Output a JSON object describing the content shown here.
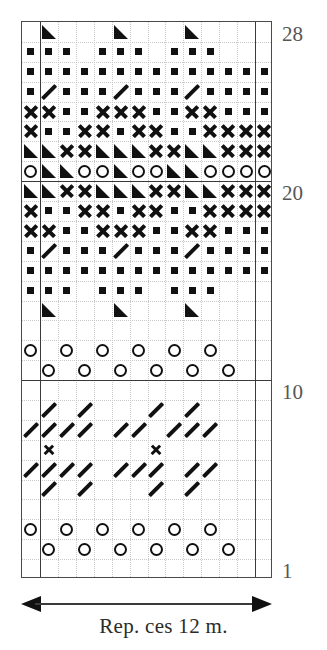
{
  "chart_data": {
    "type": "table",
    "title": "",
    "columns": 14,
    "rows": 28,
    "row_number_labels": [
      "28",
      "20",
      "10",
      "1"
    ],
    "row_numbers_shown": [
      28,
      20,
      10,
      1
    ],
    "legend": {
      "square": "filled-square",
      "cross": "cross",
      "triangle": "filled-triangle",
      "circle": "open-circle",
      "slash": "diagonal-slash",
      "empty": "blank"
    },
    "repeat_stitches": 12,
    "heavy_vertical_rules_after_columns": [
      1,
      13
    ],
    "heavy_horizontal_rules_after_rows": [
      10,
      20
    ],
    "grid": [
      [
        "empty",
        "tri",
        "empty",
        "empty",
        "empty",
        "tri",
        "empty",
        "empty",
        "empty",
        "tri",
        "empty",
        "empty",
        "empty",
        "empty"
      ],
      [
        "square",
        "square",
        "square",
        "empty",
        "square",
        "square",
        "square",
        "empty",
        "square",
        "square",
        "square",
        "empty",
        "empty",
        "empty"
      ],
      [
        "square",
        "square",
        "square",
        "square",
        "square",
        "square",
        "square",
        "square",
        "square",
        "square",
        "square",
        "square",
        "square",
        "square"
      ],
      [
        "square",
        "slash",
        "square",
        "square",
        "square",
        "slash",
        "square",
        "square",
        "square",
        "slash",
        "square",
        "square",
        "square",
        "square"
      ],
      [
        "cross",
        "cross",
        "square",
        "square",
        "cross",
        "cross",
        "cross",
        "square",
        "square",
        "cross",
        "cross",
        "square",
        "square",
        "square"
      ],
      [
        "cross",
        "square",
        "square",
        "cross",
        "cross",
        "square",
        "cross",
        "cross",
        "square",
        "square",
        "cross",
        "cross",
        "cross",
        "cross"
      ],
      [
        "tri",
        "tri",
        "cross",
        "cross",
        "tri",
        "tri",
        "tri",
        "cross",
        "cross",
        "tri",
        "tri",
        "cross",
        "cross",
        "cross"
      ],
      [
        "circle",
        "tri",
        "tri",
        "circle",
        "circle",
        "tri",
        "circle",
        "circle",
        "tri",
        "tri",
        "circle",
        "circle",
        "circle",
        "circle"
      ],
      [
        "tri",
        "tri",
        "cross",
        "cross",
        "tri",
        "tri",
        "tri",
        "cross",
        "cross",
        "tri",
        "tri",
        "cross",
        "cross",
        "cross"
      ],
      [
        "cross",
        "square",
        "square",
        "cross",
        "cross",
        "square",
        "cross",
        "cross",
        "square",
        "square",
        "cross",
        "cross",
        "cross",
        "cross"
      ],
      [
        "cross",
        "cross",
        "square",
        "square",
        "cross",
        "cross",
        "cross",
        "square",
        "square",
        "cross",
        "cross",
        "square",
        "square",
        "square"
      ],
      [
        "square",
        "slash",
        "square",
        "square",
        "square",
        "slash",
        "square",
        "square",
        "square",
        "slash",
        "square",
        "square",
        "square",
        "square"
      ],
      [
        "square",
        "square",
        "square",
        "square",
        "square",
        "square",
        "square",
        "square",
        "square",
        "square",
        "square",
        "square",
        "square",
        "square"
      ],
      [
        "square",
        "square",
        "square",
        "empty",
        "square",
        "square",
        "square",
        "empty",
        "square",
        "square",
        "square",
        "empty",
        "empty",
        "empty"
      ],
      [
        "empty",
        "tri",
        "empty",
        "empty",
        "empty",
        "tri",
        "empty",
        "empty",
        "empty",
        "tri",
        "empty",
        "empty",
        "empty",
        "empty"
      ],
      [
        "empty",
        "empty",
        "empty",
        "empty",
        "empty",
        "empty",
        "empty",
        "empty",
        "empty",
        "empty",
        "empty",
        "empty",
        "empty",
        "empty"
      ],
      [
        "circle",
        "empty",
        "circle",
        "empty",
        "circle",
        "empty",
        "circle",
        "empty",
        "circle",
        "empty",
        "circle",
        "empty",
        "empty",
        "empty"
      ],
      [
        "empty",
        "circle",
        "empty",
        "circle",
        "empty",
        "circle",
        "empty",
        "circle",
        "empty",
        "circle",
        "empty",
        "circle",
        "empty",
        "empty"
      ],
      [
        "empty",
        "empty",
        "empty",
        "empty",
        "empty",
        "empty",
        "empty",
        "empty",
        "empty",
        "empty",
        "empty",
        "empty",
        "empty",
        "empty"
      ],
      [
        "empty",
        "slash",
        "empty",
        "slash",
        "empty",
        "empty",
        "empty",
        "slash",
        "empty",
        "slash",
        "empty",
        "empty",
        "empty",
        "empty"
      ],
      [
        "slash",
        "slash",
        "slash",
        "slash",
        "empty",
        "slash",
        "slash",
        "empty",
        "slash",
        "slash",
        "slash",
        "empty",
        "empty",
        "empty"
      ],
      [
        "empty",
        "crossSmall",
        "empty",
        "empty",
        "empty",
        "empty",
        "empty",
        "crossSmall",
        "empty",
        "empty",
        "empty",
        "empty",
        "empty",
        "empty"
      ],
      [
        "slash",
        "slash",
        "slash",
        "slash",
        "empty",
        "slash",
        "slash",
        "slash",
        "empty",
        "slash",
        "slash",
        "empty",
        "empty",
        "empty"
      ],
      [
        "empty",
        "slash",
        "empty",
        "slash",
        "empty",
        "empty",
        "empty",
        "slash",
        "empty",
        "slash",
        "empty",
        "empty",
        "empty",
        "empty"
      ],
      [
        "empty",
        "empty",
        "empty",
        "empty",
        "empty",
        "empty",
        "empty",
        "empty",
        "empty",
        "empty",
        "empty",
        "empty",
        "empty",
        "empty"
      ],
      [
        "circle",
        "empty",
        "circle",
        "empty",
        "circle",
        "empty",
        "circle",
        "empty",
        "circle",
        "empty",
        "circle",
        "empty",
        "empty",
        "empty"
      ],
      [
        "empty",
        "circle",
        "empty",
        "circle",
        "empty",
        "circle",
        "empty",
        "circle",
        "empty",
        "circle",
        "empty",
        "circle",
        "empty",
        "empty"
      ],
      [
        "empty",
        "empty",
        "empty",
        "empty",
        "empty",
        "empty",
        "empty",
        "empty",
        "empty",
        "empty",
        "empty",
        "empty",
        "empty",
        "empty"
      ]
    ]
  },
  "row_labels": [
    {
      "text": "28",
      "row_from_bottom": 28
    },
    {
      "text": "20",
      "row_from_bottom": 20
    },
    {
      "text": "10",
      "row_from_bottom": 10
    },
    {
      "text": "1",
      "row_from_bottom": 1
    }
  ],
  "repeat": {
    "caption": "Rep. ces 12 m."
  },
  "colors": {
    "symbol": "#111111",
    "frame": "#4a4a4a",
    "gridline": "#c9c9c9",
    "rownum": "#555555",
    "background": "#ffffff"
  }
}
